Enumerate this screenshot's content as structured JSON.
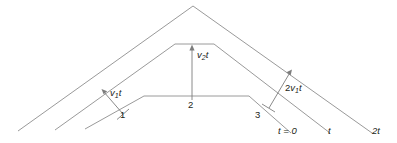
{
  "figure": {
    "type": "geometry-diagram",
    "background_color": "#ffffff",
    "line_color": "#9a9a9a",
    "text_color": "#231f20",
    "labels": {
      "v1t": "v",
      "v1t_sub": "1",
      "v1t_tail": "t",
      "v2t": "v",
      "v2t_sub": "2",
      "v2t_tail": "t",
      "two_v1t_prefix": "2",
      "two_v1t": "v",
      "two_v1t_sub": "1",
      "two_v1t_tail": "t",
      "point_1": "1",
      "point_2": "2",
      "point_3": "3",
      "t_zero": "t = 0",
      "t_one": "t",
      "t_two": "2t"
    },
    "wavefronts": [
      {
        "name": "wavefront-t-0",
        "label": "t = 0",
        "points": "85,129 144,96 249,96 291,133"
      },
      {
        "name": "wavefront-t",
        "label": "t",
        "points": "55,130 175,44 214,44 330,133"
      },
      {
        "name": "wavefront-2t",
        "label": "2t",
        "points": "18,131 193,6 372,133"
      }
    ],
    "measures": [
      {
        "name": "v1t-arrow",
        "label": "v1t",
        "from": "123,114",
        "to": "102,90"
      },
      {
        "name": "v2t-arrow",
        "label": "v2t",
        "from": "192,101",
        "to": "192,46"
      },
      {
        "name": "two-v1t-arrow",
        "label": "2v1t",
        "from": "269,108",
        "to": "291,71"
      }
    ]
  }
}
